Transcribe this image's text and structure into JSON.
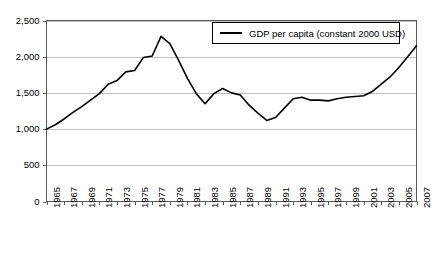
{
  "chart_data": {
    "type": "line",
    "title": "",
    "subtitle": "",
    "xlabel": "",
    "ylabel": "",
    "grid": true,
    "legend_position": "top-right",
    "xlim": [
      1965,
      2007
    ],
    "ylim": [
      0,
      2500
    ],
    "ytick_labels": [
      "2,500",
      "2,000",
      "1,500",
      "1,000",
      "500",
      "0"
    ],
    "ytick_values": [
      2500,
      2000,
      1500,
      1000,
      500,
      0
    ],
    "xtick_labels": [
      "1965",
      "1967",
      "1969",
      "1971",
      "1973",
      "1975",
      "1977",
      "1979",
      "1981",
      "1983",
      "1985",
      "1987",
      "1989",
      "1991",
      "1993",
      "1995",
      "1997",
      "1999",
      "2001",
      "2003",
      "2005",
      "2007"
    ],
    "xtick_values": [
      1965,
      1967,
      1969,
      1971,
      1973,
      1975,
      1977,
      1979,
      1981,
      1983,
      1985,
      1987,
      1989,
      1991,
      1993,
      1995,
      1997,
      1999,
      2001,
      2003,
      2005,
      2007
    ],
    "line_color": "#000000",
    "grid_color": "#bfbfbf",
    "axis_color": "#595959",
    "series": [
      {
        "name": "GDP per capita (constant 2000 USD)",
        "x": [
          1965,
          1966,
          1967,
          1968,
          1969,
          1970,
          1971,
          1972,
          1973,
          1974,
          1975,
          1976,
          1977,
          1978,
          1979,
          1980,
          1981,
          1982,
          1983,
          1984,
          1985,
          1986,
          1987,
          1988,
          1989,
          1990,
          1991,
          1992,
          1993,
          1994,
          1995,
          1996,
          1997,
          1998,
          1999,
          2000,
          2001,
          2002,
          2003,
          2004,
          2005,
          2006,
          2007
        ],
        "values": [
          1000,
          1060,
          1140,
          1230,
          1310,
          1400,
          1490,
          1620,
          1670,
          1790,
          1810,
          1990,
          2010,
          2280,
          2180,
          1950,
          1700,
          1490,
          1350,
          1490,
          1560,
          1500,
          1470,
          1330,
          1220,
          1120,
          1160,
          1290,
          1420,
          1440,
          1400,
          1400,
          1390,
          1420,
          1440,
          1450,
          1460,
          1520,
          1620,
          1720,
          1850,
          2000,
          2150
        ]
      }
    ]
  },
  "legend": {
    "entries": [
      {
        "label": "GDP per capita (constant 2000 USD)",
        "swatch": "line-swatch"
      }
    ]
  }
}
